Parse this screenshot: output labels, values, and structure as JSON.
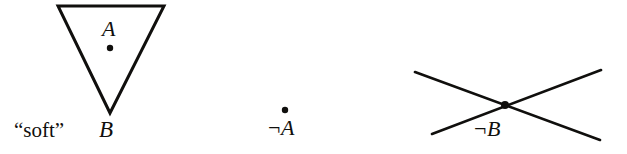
{
  "figure": {
    "caption_type": "logic-topology-diagram",
    "background_color": "#ffffff",
    "ink_color": "#100f0d",
    "width": 627,
    "height": 154
  },
  "panels": [
    {
      "id": "panel-soft-triangle",
      "shape": "inverted-triangle",
      "interior_label": "A",
      "point_marker": "dot",
      "qualifier_label": "“soft”",
      "apex_label": "B",
      "geometry": {
        "top_left": [
          58,
          6
        ],
        "top_right": [
          164,
          6
        ],
        "apex": [
          110,
          113
        ],
        "dot": [
          110,
          48
        ]
      }
    },
    {
      "id": "panel-not-a",
      "shape": "isolated-point",
      "point_marker": "dot",
      "label": "¬A",
      "negation_glyph": "¬",
      "operand": "A",
      "geometry": {
        "dot": [
          285,
          110
        ]
      }
    },
    {
      "id": "panel-not-b",
      "shape": "crossing-lines",
      "point_marker": "dot",
      "label": "¬B",
      "negation_glyph": "¬",
      "operand": "B",
      "geometry": {
        "line_one": [
          [
            415,
            72
          ],
          [
            600,
            140
          ]
        ],
        "line_two": [
          [
            432,
            134
          ],
          [
            601,
            70
          ]
        ],
        "intersection": [
          505,
          105
        ]
      }
    }
  ],
  "labels": {
    "a_inside": "A",
    "soft": "“soft”",
    "b_apex": "B",
    "not_a_glyph": "¬",
    "not_a_operand": "A",
    "not_b_glyph": "¬",
    "not_b_operand": "B"
  }
}
